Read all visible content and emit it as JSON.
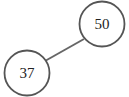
{
  "diagram": {
    "type": "binary-tree",
    "colors": {
      "stroke": "#555555",
      "edge": "#666666",
      "fill": "#ffffff",
      "text": "#222222"
    },
    "nodes": [
      {
        "id": "n50",
        "label": "50",
        "cx": 102,
        "cy": 24,
        "r": 23
      },
      {
        "id": "n37",
        "label": "37",
        "cx": 27,
        "cy": 73,
        "r": 23
      }
    ],
    "edges": [
      {
        "from": "n50",
        "to": "n37",
        "x1": 84,
        "y1": 39,
        "x2": 45,
        "y2": 61
      }
    ]
  }
}
